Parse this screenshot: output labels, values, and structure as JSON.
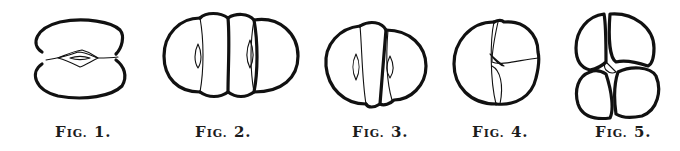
{
  "figures": [
    {
      "id": "fig1",
      "prefix": "F",
      "small": "IG.",
      "number": "1.",
      "description": "two-cell stage, horizontal"
    },
    {
      "id": "fig2",
      "prefix": "F",
      "small": "IG.",
      "number": "2.",
      "description": "four-cell stage, row of four"
    },
    {
      "id": "fig3",
      "prefix": "F",
      "small": "IG.",
      "number": "3.",
      "description": "four-cell stage, oblique"
    },
    {
      "id": "fig4",
      "prefix": "F",
      "small": "IG.",
      "number": "4.",
      "description": "three-cell stage"
    },
    {
      "id": "fig5",
      "prefix": "F",
      "small": "IG.",
      "number": "5.",
      "description": "four-cell stage, quadrant"
    }
  ],
  "colors": {
    "ink": "#111111",
    "paper": "#ffffff"
  }
}
